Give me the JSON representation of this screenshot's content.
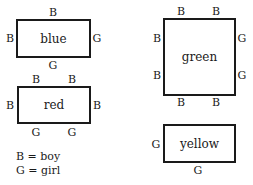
{
  "rectangles": [
    {
      "name": "blue",
      "label": "blue",
      "top": [
        "B"
      ],
      "bottom": [
        "G"
      ],
      "left": [
        "B"
      ],
      "right": [
        "G"
      ]
    },
    {
      "name": "red",
      "label": "red",
      "top": [
        "B",
        "B"
      ],
      "bottom": [
        "G",
        "G"
      ],
      "left": [
        "B"
      ],
      "right": [
        "B"
      ]
    },
    {
      "name": "green",
      "label": "green",
      "top": [
        "B",
        "B"
      ],
      "bottom": [
        "B",
        "B"
      ],
      "left": [
        "B",
        "B"
      ],
      "right": [
        "G",
        "G"
      ]
    },
    {
      "name": "yellow",
      "label": "yellow",
      "top": [],
      "bottom": [
        "G"
      ],
      "left": [
        "G"
      ],
      "right": []
    }
  ],
  "legend": {
    "boy": "B = boy",
    "girl": "G = girl"
  }
}
